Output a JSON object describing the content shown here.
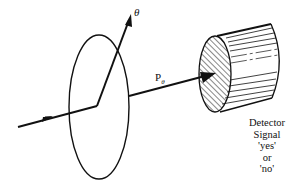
{
  "diagram": {
    "labels": {
      "theta": "θ",
      "p_main": "P",
      "p_sub": "θ",
      "detector_lines": [
        "Detector",
        "Signal",
        "'yes'",
        "or",
        "'no'"
      ]
    },
    "colors": {
      "ink": "#111111",
      "background": "#ffffff"
    }
  }
}
